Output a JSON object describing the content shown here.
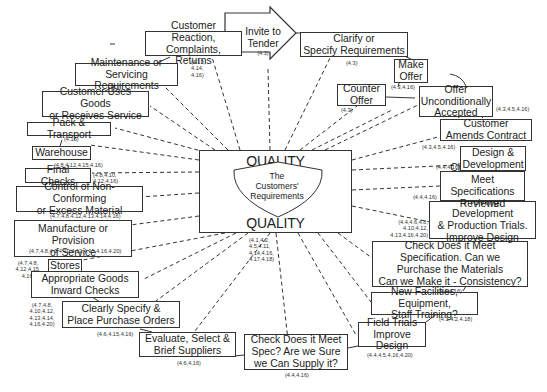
{
  "center": {
    "quality_top": "QUALITY",
    "quality_bottom": "QUALITY",
    "shield_text": "The\nCustomers'\nRequirements",
    "ref": "(4.1,4.2,\n4.5,4.11,\n4.14,4.16,\n4.17,4.18)"
  },
  "invite": {
    "label": "Invite to\nTender",
    "ref": "(4.3)"
  },
  "nodes": [
    {
      "id": "customer-reaction",
      "label": "Customer Reaction,\nComplaints, Returns",
      "ref": "(4.13,\n4.14,\n4.16)"
    },
    {
      "id": "maintenance",
      "label": "Maintenance or\nServicing Requirements",
      "ref": "(4.19)"
    },
    {
      "id": "customer-uses",
      "label": "Customer Uses Goods\nor Receives Service",
      "ref": ""
    },
    {
      "id": "pack-transport",
      "label": "Pack & Transport",
      "ref": "(4.15)"
    },
    {
      "id": "warehouse",
      "label": "Warehouse",
      "ref": "(4.8,4.12,4.15,4.16)"
    },
    {
      "id": "final-checks",
      "label": "Final Checks",
      "ref": "(4.8,4.10,\n4.12,4.16)"
    },
    {
      "id": "control-nonconforming",
      "label": "Control of Non-Conforming\nor Excess Material",
      "ref": "(4.7,4.8,4.12,4.13,4.14,4.16)"
    },
    {
      "id": "manufacture",
      "label": "Manufacture or Provision\nof Service",
      "ref": "(4.7,4.8,4.9,4.10,4.12,4.15,4.16,4.20)"
    },
    {
      "id": "stores",
      "label": "Stores",
      "ref": "(4.7,4.8,\n4.12,4.15,\n4.16)"
    },
    {
      "id": "goods-inward",
      "label": "Appropriate Goods\nInward Checks",
      "ref": "(4.7,4.8,\n4.10,4.12,\n4.13,4.14,\n4.16,4.20)"
    },
    {
      "id": "purchase-orders",
      "label": "Clearly Specify &\nPlace Purchase Orders",
      "ref": "(4.6,4.15,4.16)"
    },
    {
      "id": "evaluate-suppliers",
      "label": "Evaluate, Select &\nBrief Suppliers",
      "ref": "(4.6,4.16)"
    },
    {
      "id": "check-supply",
      "label": "Check Does it Meet\nSpec? Are we Sure\nwe Can Supply it?",
      "ref": "(4.4,4.16)"
    },
    {
      "id": "field-trials",
      "label": "Field Trials\nImprove Design",
      "ref": "(4.4,4.5,4.16,4.20)"
    },
    {
      "id": "new-facilities",
      "label": "New Facilities, Equipment,\nStaff Training?",
      "ref": "(4.1,4.2,4.18)"
    },
    {
      "id": "check-consistency",
      "label": "Check Does it Meet\nSpecification. Can we\nPurchase the Materials\nCan we Make it - Consistency?",
      "ref": "(4.4,4.16)"
    },
    {
      "id": "proving",
      "label": "Proving, Development\n& Production Trials.\nImprove Design",
      "ref": "(4.4,4.6,4.8,\n4.10,4.12,\n4.13,4.16,4.20)"
    },
    {
      "id": "check-spec-reviewed",
      "label": "Check Does it\nMeet Specifications\nReviewed",
      "ref": "(4.4,4.16)"
    },
    {
      "id": "design-development",
      "label": "Design &\nDevelopment",
      "ref": "(4.4,4.16)"
    },
    {
      "id": "amends-contract",
      "label": "Customer\nAmends Contract",
      "ref": "(4.3,4.5,4.16)"
    },
    {
      "id": "offer-accepted",
      "label": "Offer\nUnconditionally\nAccepted",
      "ref": "(4.3,4.5,4.16)"
    },
    {
      "id": "counter-offer",
      "label": "Counter\nOffer",
      "ref": "(4.3)"
    },
    {
      "id": "make-offer",
      "label": "Make\nOffer",
      "ref": "(4.3,4.16)"
    },
    {
      "id": "clarify",
      "label": "Clarify or\nSpecify Requirements",
      "ref": "(4.3)"
    }
  ]
}
